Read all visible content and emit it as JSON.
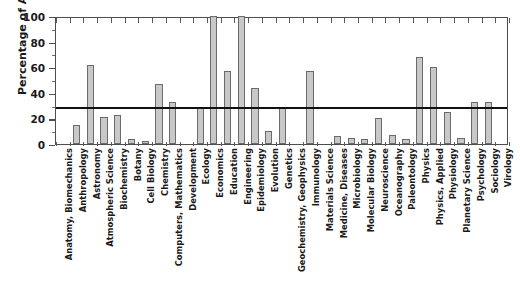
{
  "chart_data": {
    "type": "bar",
    "title": "",
    "xlabel": "",
    "ylabel": "Percentage of Articles",
    "ylim": [
      0,
      100
    ],
    "yticks": [
      0,
      20,
      40,
      60,
      80,
      100
    ],
    "ytick_labels": [
      "0",
      "20",
      "40",
      "60",
      "80",
      "100"
    ],
    "grid": false,
    "legend": "none",
    "bar_color": "#c8c8c8",
    "bar_edge_color": "#6b6b6b",
    "reference_line": {
      "value": 28,
      "orientation": "horizontal",
      "color": "#111111",
      "label": ""
    },
    "categories": [
      "Anatomy, Biomechanics",
      "Anthropology",
      "Astronomy",
      "Atmospheric Science",
      "Biochemistry",
      "Botany",
      "Cell Biology",
      "Chemistry",
      "Computers, Mathematics",
      "Development",
      "Ecology",
      "Economics",
      "Education",
      "Engineering",
      "Epidemiology",
      "Evolution",
      "Genetics",
      "Geochemistry, Geophysics",
      "Immunology",
      "Materials Science",
      "Medicine, Diseases",
      "Microbiology",
      "Molecular Biology",
      "Neuroscience",
      "Oceanography",
      "Paleontology",
      "Physics",
      "Physics, Applied",
      "Physiology",
      "Planetary Science",
      "Psychology",
      "Sociology",
      "Virology"
    ],
    "values": [
      0,
      15,
      62,
      21,
      23,
      4,
      2,
      47,
      33,
      0,
      29,
      100,
      57,
      100,
      44,
      10,
      29,
      0,
      57,
      0,
      6,
      5,
      4,
      20,
      7,
      4,
      68,
      60,
      25,
      5,
      33,
      33,
      0
    ]
  }
}
